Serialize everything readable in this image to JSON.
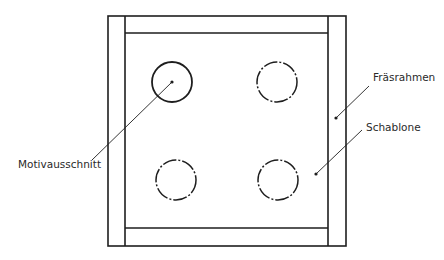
{
  "diagram": {
    "type": "technical-schematic",
    "labels": {
      "cutout": "Motivausschnitt",
      "frame": "Fräsrahmen",
      "template": "Schablone"
    },
    "colors": {
      "stroke": "#1e1e1e",
      "background": "#ffffff"
    },
    "frame": {
      "outer": {
        "x": 108,
        "y": 16,
        "w": 238,
        "h": 230
      },
      "inner": {
        "x": 125,
        "y": 33,
        "w": 203,
        "h": 195
      }
    },
    "circles": [
      {
        "name": "cutout-solid",
        "cx": 172,
        "cy": 82,
        "r": 20,
        "style": "solid"
      },
      {
        "name": "cutout-dashed-top-right",
        "cx": 277,
        "cy": 82,
        "r": 20,
        "style": "dash-dot"
      },
      {
        "name": "cutout-dashed-bottom-left",
        "cx": 176,
        "cy": 180,
        "r": 20,
        "style": "dash-dot"
      },
      {
        "name": "cutout-dashed-bottom-right",
        "cx": 278,
        "cy": 180,
        "r": 20,
        "style": "dash-dot"
      }
    ]
  }
}
